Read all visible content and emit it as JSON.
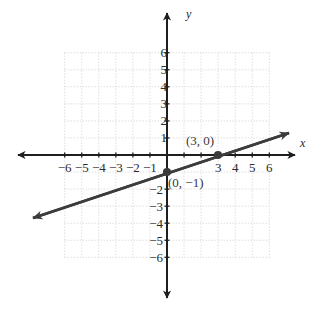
{
  "figure": {
    "background_color": "#ffffff",
    "axis_color": "#1e1e1e",
    "grid_color": "#cfcfcf",
    "line_color": "#3c3c3c",
    "point_color": "#3a3a3a",
    "label_color": "#2b2b2b",
    "x_axis_letter": "x",
    "y_axis_letter": "y"
  },
  "chart_data": {
    "type": "line",
    "title": "",
    "xlabel": "x",
    "ylabel": "y",
    "xlim": [
      -6,
      6
    ],
    "ylim": [
      -6,
      6
    ],
    "grid": true,
    "grid_style": "dotted",
    "legend": "none",
    "x_ticks": [
      -6,
      -5,
      -4,
      -3,
      -2,
      -1,
      1,
      2,
      3,
      4,
      5,
      6
    ],
    "y_ticks": [
      -6,
      -5,
      -4,
      -3,
      -2,
      -1,
      1,
      2,
      3,
      4,
      5,
      6
    ],
    "x_tick_labels_shown": [
      "−6",
      "−5",
      "−4",
      "−3",
      "−2",
      "−1",
      "3",
      "4",
      "5",
      "6"
    ],
    "y_tick_labels_shown": [
      "6",
      "5",
      "4",
      "3",
      "2",
      "1",
      "−2",
      "−3",
      "−4",
      "−5",
      "−6"
    ],
    "series": [
      {
        "name": "line",
        "slope": 0.3333,
        "intercept": -1,
        "x": [
          -6,
          6
        ],
        "y": [
          -3,
          1
        ],
        "arrows": "both"
      }
    ],
    "points": [
      {
        "x": 3,
        "y": 0,
        "label": "(3, 0)"
      },
      {
        "x": 0,
        "y": -1,
        "label": "(0, −1)"
      }
    ],
    "annotations": [
      {
        "text": "(3, 0)",
        "x": 3,
        "y": 0
      },
      {
        "text": "(0, −1)",
        "x": 0,
        "y": -1
      }
    ]
  },
  "x_tick_labels": [
    {
      "value": -6,
      "text": "−6"
    },
    {
      "value": -5,
      "text": "−5"
    },
    {
      "value": -4,
      "text": "−4"
    },
    {
      "value": -3,
      "text": "−3"
    },
    {
      "value": -2,
      "text": "−2"
    },
    {
      "value": -1,
      "text": "−1"
    },
    {
      "value": 3,
      "text": "3"
    },
    {
      "value": 4,
      "text": "4"
    },
    {
      "value": 5,
      "text": "5"
    },
    {
      "value": 6,
      "text": "6"
    }
  ],
  "y_tick_labels": [
    {
      "value": 6,
      "text": "6"
    },
    {
      "value": 5,
      "text": "5"
    },
    {
      "value": 4,
      "text": "4"
    },
    {
      "value": 3,
      "text": "3"
    },
    {
      "value": 2,
      "text": "2"
    },
    {
      "value": 1,
      "text": "1"
    },
    {
      "value": -2,
      "text": "−2"
    },
    {
      "value": -3,
      "text": "−3"
    },
    {
      "value": -4,
      "text": "−4"
    },
    {
      "value": -5,
      "text": "−5"
    },
    {
      "value": -6,
      "text": "−6"
    }
  ],
  "point_labels": {
    "point_a": "(3, 0)",
    "point_b": "(0, −1)"
  }
}
